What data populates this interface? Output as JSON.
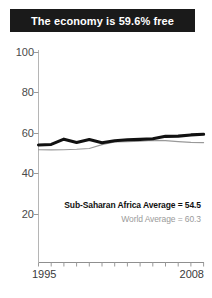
{
  "title": {
    "text": "The economy is 59.6% free"
  },
  "annotations": {
    "country_average": "Sub-Saharan Africa Average = 54.5",
    "world_average": "World Average = 60.3"
  },
  "colors": {
    "banner_bg": "#1a1a1a",
    "banner_text": "#ffffff",
    "country_line": "#111111",
    "world_line": "#999999",
    "axis": "#aaaaaa",
    "tick_label": "#4a4a4a",
    "annot_primary": "#111111",
    "annot_secondary": "#9a9a9a"
  },
  "chart_data": {
    "type": "line",
    "title": "The economy is 59.6% free",
    "xlabel": "",
    "ylabel": "",
    "xlim": [
      1995,
      2008
    ],
    "ylim": [
      0,
      100
    ],
    "yticks": [
      20,
      40,
      60,
      80,
      100
    ],
    "xticks": [
      1995,
      1996,
      1997,
      1998,
      1999,
      2000,
      2001,
      2002,
      2003,
      2004,
      2005,
      2006,
      2007,
      2008
    ],
    "xtick_labels_shown": [
      "1995",
      "2008"
    ],
    "grid": false,
    "legend": "none",
    "x": [
      1995,
      1996,
      1997,
      1998,
      1999,
      2000,
      2001,
      2002,
      2003,
      2004,
      2005,
      2006,
      2007,
      2008
    ],
    "series": [
      {
        "name": "Country score",
        "style": "thick-black",
        "color": "#111111",
        "values": [
          54.3,
          54.6,
          57.2,
          55.6,
          57.0,
          55.4,
          56.4,
          56.9,
          57.1,
          57.4,
          58.6,
          58.7,
          59.3,
          59.6
        ]
      },
      {
        "name": "World Average",
        "style": "thin-gray",
        "color": "#999999",
        "values": [
          52.0,
          51.9,
          52.0,
          52.2,
          52.6,
          54.5,
          55.8,
          56.0,
          56.2,
          56.6,
          56.5,
          56.0,
          55.6,
          55.5
        ]
      }
    ],
    "annotations": [
      {
        "label": "Sub-Saharan Africa Average",
        "value": 54.5
      },
      {
        "label": "World Average",
        "value": 60.3
      }
    ]
  },
  "axis_labels": {
    "y": [
      "100",
      "80",
      "60",
      "40",
      "20"
    ],
    "x_start": "1995",
    "x_end": "2008"
  }
}
